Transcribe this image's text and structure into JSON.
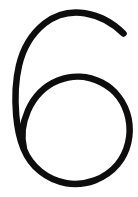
{
  "image": {
    "width": 138,
    "height": 197,
    "background_color": "#ffffff",
    "alt_text": "6"
  },
  "glyph": {
    "character": "6",
    "name": "digit-six",
    "style": "handwritten single-stroke",
    "stroke_color": "#0d0d0d",
    "stroke_width_px": 6.5,
    "stroke_cap": "round",
    "fill": "none"
  },
  "chart_data": {
    "type": "line",
    "title": "",
    "subtitle": "",
    "xlabel": "",
    "ylabel": "",
    "grid": false,
    "legend": "none",
    "xlim": [
      0,
      138
    ],
    "ylim": [
      0,
      197
    ],
    "annotations": [
      "6"
    ],
    "series": [
      {
        "name": "six-stroke",
        "color": "#0d0d0d",
        "path": "M123.5,33.5 C113,23 99,15.5 85,13.2 C70,10.8 56,14.5 44.5,23.5 C32,33.5 23,48.5 19,65.5 C15.2,81.5 14.8,99 16.2,115.5 C17.3,128 19.6,139 23.5,148.5 C31,167 47,180 66.5,183.2 C86,186.2 105.5,178.8 117.5,164.5 C128,151.8 131.8,134.5 128.5,118.5 C125.2,102.5 115.2,89.5 101.5,82.5 C88,75.5 72,74.8 58,80.5 C44.5,86 34,97 28,110.5 C22.5,123 21,137 24,149",
        "keypoints": [
          {
            "label": "terminal-tip-upper-right",
            "x": 123.5,
            "y": 33.5
          },
          {
            "label": "apex-top",
            "x": 72,
            "y": 13
          },
          {
            "label": "stem-left-extreme",
            "x": 15,
            "y": 95
          },
          {
            "label": "bowl-top",
            "x": 75,
            "y": 78
          },
          {
            "label": "bowl-right",
            "x": 130,
            "y": 130
          },
          {
            "label": "bowl-bottom",
            "x": 74,
            "y": 183
          },
          {
            "label": "bowl-left",
            "x": 20,
            "y": 132
          },
          {
            "label": "bowl-closure-near-stem",
            "x": 24,
            "y": 149
          }
        ]
      }
    ]
  }
}
